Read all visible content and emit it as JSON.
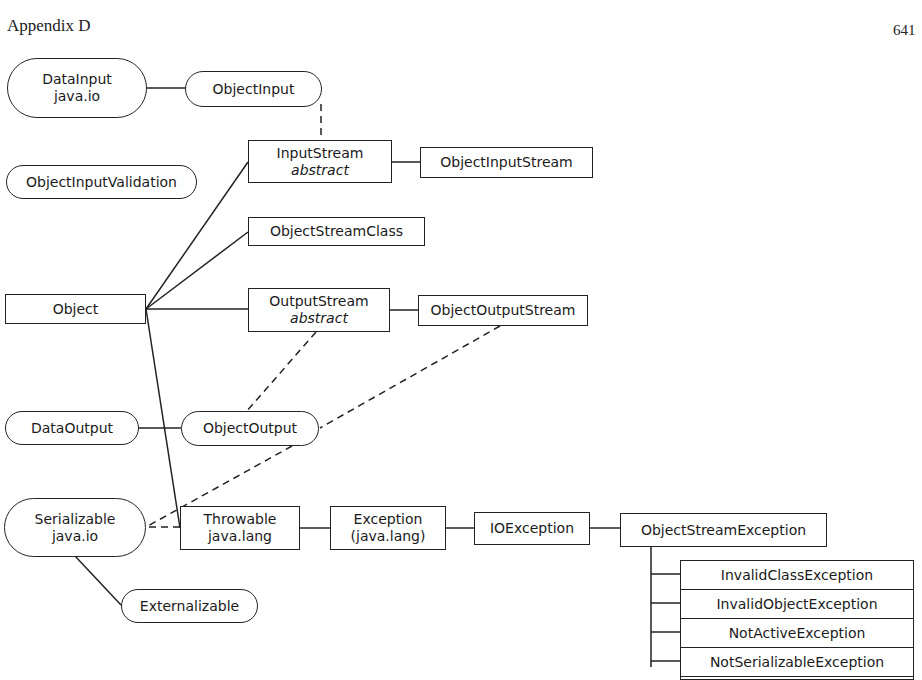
{
  "header": {
    "title": "Appendix D",
    "page_number": "641"
  },
  "nodes": {
    "data_input": {
      "name": "DataInput",
      "package": "java.io",
      "kind": "interface"
    },
    "object_input": {
      "name": "ObjectInput",
      "kind": "interface"
    },
    "input_stream": {
      "name": "InputStream",
      "modifier": "abstract",
      "kind": "class"
    },
    "object_input_stream": {
      "name": "ObjectInputStream",
      "kind": "class"
    },
    "object_input_validation": {
      "name": "ObjectInputValidation",
      "kind": "interface"
    },
    "object_stream_class": {
      "name": "ObjectStreamClass",
      "kind": "class"
    },
    "object": {
      "name": "Object",
      "kind": "class"
    },
    "output_stream": {
      "name": "OutputStream",
      "modifier": "abstract",
      "kind": "class"
    },
    "object_output_stream": {
      "name": "ObjectOutputStream",
      "kind": "class"
    },
    "data_output": {
      "name": "DataOutput",
      "kind": "interface"
    },
    "object_output": {
      "name": "ObjectOutput",
      "kind": "interface"
    },
    "serializable": {
      "name": "Serializable",
      "package": "java.io",
      "kind": "interface"
    },
    "throwable": {
      "name": "Throwable",
      "package": "java.lang",
      "kind": "class"
    },
    "exception": {
      "name": "Exception",
      "package": "(java.lang)",
      "kind": "class"
    },
    "io_exception": {
      "name": "IOException",
      "kind": "class"
    },
    "object_stream_exception": {
      "name": "ObjectStreamException",
      "kind": "class"
    },
    "externalizable": {
      "name": "Externalizable",
      "kind": "interface"
    }
  },
  "object_stream_exception_subclasses": [
    "InvalidClassException",
    "InvalidObjectException",
    "NotActiveException",
    "NotSerializableException"
  ],
  "edges": [
    {
      "from": "DataInput",
      "to": "ObjectInput",
      "style": "solid"
    },
    {
      "from": "ObjectInput",
      "to": "InputStream",
      "style": "dashed"
    },
    {
      "from": "Object",
      "to": "InputStream",
      "style": "solid"
    },
    {
      "from": "InputStream",
      "to": "ObjectInputStream",
      "style": "solid"
    },
    {
      "from": "Object",
      "to": "ObjectStreamClass",
      "style": "solid"
    },
    {
      "from": "Object",
      "to": "OutputStream",
      "style": "solid"
    },
    {
      "from": "OutputStream",
      "to": "ObjectOutputStream",
      "style": "solid"
    },
    {
      "from": "OutputStream",
      "to": "ObjectOutput",
      "style": "dashed"
    },
    {
      "from": "ObjectOutputStream",
      "to": "Serializable",
      "style": "dashed"
    },
    {
      "from": "DataOutput",
      "to": "ObjectOutput",
      "style": "solid"
    },
    {
      "from": "ObjectOutput",
      "to": "Serializable",
      "style": "dashed"
    },
    {
      "from": "Object",
      "to": "Throwable",
      "style": "solid"
    },
    {
      "from": "Throwable",
      "to": "Serializable",
      "style": "dashed"
    },
    {
      "from": "Throwable",
      "to": "Exception",
      "style": "solid"
    },
    {
      "from": "Exception",
      "to": "IOException",
      "style": "solid"
    },
    {
      "from": "IOException",
      "to": "ObjectStreamException",
      "style": "solid"
    },
    {
      "from": "Serializable",
      "to": "Externalizable",
      "style": "solid"
    },
    {
      "from": "ObjectStreamException",
      "to": "InvalidClassException",
      "style": "solid"
    },
    {
      "from": "ObjectStreamException",
      "to": "InvalidObjectException",
      "style": "solid"
    },
    {
      "from": "ObjectStreamException",
      "to": "NotActiveException",
      "style": "solid"
    },
    {
      "from": "ObjectStreamException",
      "to": "NotSerializableException",
      "style": "solid"
    }
  ]
}
